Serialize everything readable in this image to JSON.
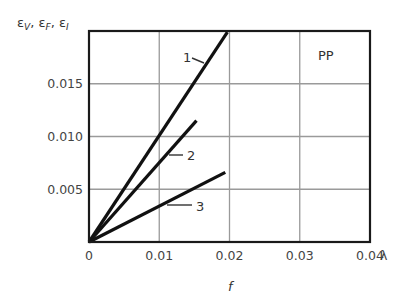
{
  "chart_data": {
    "type": "line",
    "title": "",
    "annotation": "PP",
    "ylabel": "εV, εF, εI",
    "ylabel_parts": [
      {
        "sym": "ε",
        "sub": "V",
        "sep": ", "
      },
      {
        "sym": "ε",
        "sub": "F",
        "sep": ", "
      },
      {
        "sym": "ε",
        "sub": "I",
        "sep": ""
      }
    ],
    "xlabel": "f",
    "x_axis_symbol": "λ",
    "xlim": [
      0,
      0.04
    ],
    "ylim": [
      0,
      0.02
    ],
    "x_ticks": [
      {
        "value": 0,
        "label": "0"
      },
      {
        "value": 0.01,
        "label": "0.01"
      },
      {
        "value": 0.02,
        "label": "0.02"
      },
      {
        "value": 0.03,
        "label": "0.03"
      },
      {
        "value": 0.04,
        "label": "0.04"
      }
    ],
    "y_ticks": [
      {
        "value": 0.005,
        "label": "0.005"
      },
      {
        "value": 0.01,
        "label": "0.010"
      },
      {
        "value": 0.015,
        "label": "0.015"
      }
    ],
    "grid": true,
    "series": [
      {
        "name": "1",
        "x": [
          0,
          0.0197
        ],
        "y": [
          0,
          0.0199
        ],
        "label_pos": {
          "x": 0.0143,
          "y": 0.0178
        }
      },
      {
        "name": "2",
        "x": [
          0,
          0.0153
        ],
        "y": [
          0,
          0.0115
        ],
        "label_pos": {
          "x": 0.014,
          "y": 0.0083
        }
      },
      {
        "name": "3",
        "x": [
          0,
          0.0194
        ],
        "y": [
          0,
          0.0066
        ],
        "label_pos": {
          "x": 0.012,
          "y": 0.0032
        }
      }
    ]
  },
  "colors": {
    "frame": "#1a1a1a",
    "grid": "#9a9a9a",
    "line": "#111111",
    "text": "#444444"
  }
}
